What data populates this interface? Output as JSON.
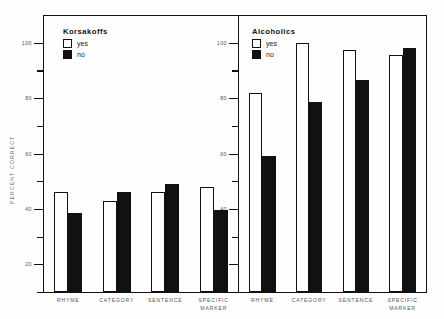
{
  "chart_data": {
    "type": "bar",
    "title": "",
    "xlabel": "",
    "ylabel": "PERCENT CORRECT",
    "ylim": [
      10,
      110
    ],
    "ytick_major": [
      20,
      40,
      60,
      80,
      100
    ],
    "ytick_minor": [
      30,
      50,
      70,
      90,
      110
    ],
    "grid": false,
    "legend_position": "top-left inside each panel",
    "categories": [
      "RHYME",
      "CATEGORY",
      "SENTENCE",
      "SPECIFIC MARKER"
    ],
    "panels": [
      {
        "name": "Korsakoffs",
        "series": [
          {
            "name": "yes",
            "color": "#ffffff",
            "values": [
              46,
              43,
              46,
              48
            ]
          },
          {
            "name": "no",
            "color": "#111111",
            "values": [
              38.5,
              46,
              49,
              39.5
            ]
          }
        ]
      },
      {
        "name": "Alcoholics",
        "series": [
          {
            "name": "yes",
            "color": "#ffffff",
            "values": [
              82,
              100,
              97.5,
              95.5
            ]
          },
          {
            "name": "no",
            "color": "#111111",
            "values": [
              59,
              78.5,
              86.5,
              98
            ]
          }
        ]
      }
    ]
  },
  "axis": {
    "ylabel": "PERCENT CORRECT",
    "ticks": [
      {
        "value": 100,
        "label": "100",
        "type": "major"
      },
      {
        "value": 90,
        "label": "",
        "type": "minor"
      },
      {
        "value": 80,
        "label": "80",
        "type": "major"
      },
      {
        "value": 70,
        "label": "",
        "type": "minor"
      },
      {
        "value": 60,
        "label": "60",
        "type": "major"
      },
      {
        "value": 50,
        "label": "",
        "type": "minor"
      },
      {
        "value": 40,
        "label": "40",
        "type": "major"
      },
      {
        "value": 30,
        "label": "",
        "type": "minor"
      },
      {
        "value": 20,
        "label": "20",
        "type": "major"
      },
      {
        "value": 10,
        "label": "",
        "type": "minor"
      }
    ]
  },
  "panel_left": {
    "legend_title": "Korsakoffs",
    "legend_yes": "yes",
    "legend_no": "no",
    "categories": [
      "RHYME",
      "CATEGORY",
      "SENTENCE",
      "SPECIFIC MARKER"
    ]
  },
  "panel_right": {
    "legend_title": "Alcoholics",
    "legend_yes": "yes",
    "legend_no": "no",
    "categories": [
      "RHYME",
      "CATEGORY",
      "SENTENCE",
      "SPECIFIC MARKER"
    ]
  }
}
